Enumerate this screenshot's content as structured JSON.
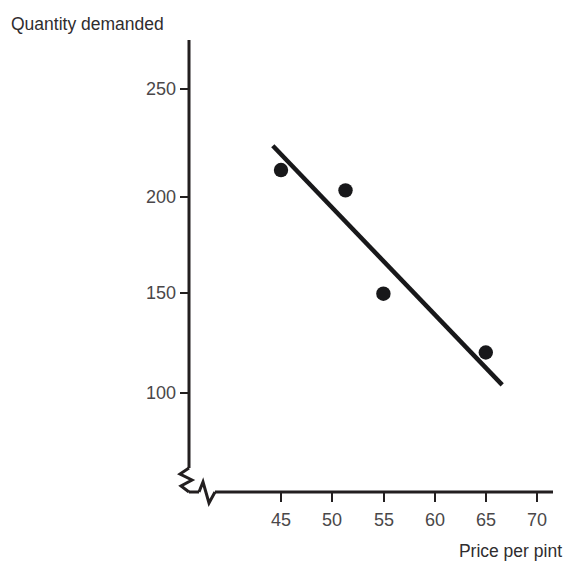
{
  "chart_data": {
    "type": "scatter",
    "title": "",
    "subtitle": "",
    "xlabel": "Price per pint",
    "ylabel": "Quantity demanded",
    "x": [
      45,
      51.3,
      55,
      65
    ],
    "values": [
      210,
      200,
      149,
      120
    ],
    "points": [
      {
        "x": 45,
        "y": 210
      },
      {
        "x": 51.3,
        "y": 200
      },
      {
        "x": 55,
        "y": 149
      },
      {
        "x": 65,
        "y": 120
      }
    ],
    "series": [
      {
        "name": "Demand observations",
        "x": [
          45,
          51.3,
          55,
          65
        ],
        "values": [
          210,
          200,
          149,
          120
        ]
      },
      {
        "name": "Line of best fit",
        "type": "line",
        "x": [
          44.2,
          66.6
        ],
        "values": [
          222,
          104
        ]
      }
    ],
    "trendline": {
      "x_start": 44.2,
      "y_start": 222,
      "x_end": 66.6,
      "y_end": 104
    },
    "xlim": [
      41.5,
      71.5
    ],
    "ylim": [
      60,
      270
    ],
    "xticks": [
      45,
      50,
      55,
      60,
      65,
      70
    ],
    "yticks": [
      100,
      150,
      200,
      250
    ],
    "xtick_labels": [
      "45",
      "50",
      "55",
      "60",
      "65",
      "70"
    ],
    "ytick_labels": [
      "100",
      "150",
      "200",
      "250"
    ],
    "grid": false,
    "legend": "none",
    "axis_break_x": true,
    "axis_break_y": true,
    "marker_color": "#18181a",
    "line_color": "#18181a",
    "axis_color": "#231f20",
    "background_color": "#ffffff"
  }
}
